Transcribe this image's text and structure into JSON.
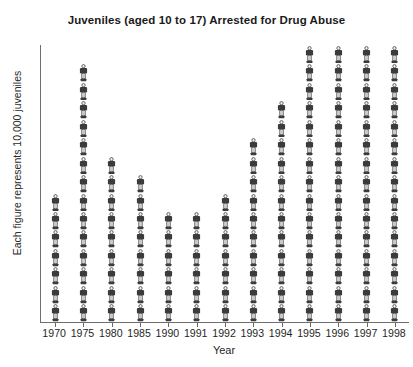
{
  "chart_data": {
    "type": "bar",
    "style": "pictograph",
    "title": "Juveniles (aged 10 to 17) Arrested for Drug Abuse",
    "xlabel": "Year",
    "ylabel": "Each figure represents 10,000 juveniles",
    "unit_per_icon": 10000,
    "icon": "person-icon",
    "legend": "none",
    "grid": "off",
    "categories": [
      "1970",
      "1975",
      "1980",
      "1985",
      "1990",
      "1991",
      "1992",
      "1993",
      "1994",
      "1995",
      "1996",
      "1997",
      "1998"
    ],
    "icon_counts": [
      7,
      14,
      9,
      8,
      6,
      6,
      7,
      10,
      12,
      15,
      15,
      15,
      15
    ],
    "values": [
      70000,
      140000,
      90000,
      80000,
      60000,
      60000,
      70000,
      100000,
      120000,
      150000,
      150000,
      150000,
      150000
    ],
    "ylim_icons": [
      0,
      15
    ],
    "colors": {
      "figure_dark": "#3b3b3b",
      "figure_light": "#efefef",
      "figure_outline": "#4a4a4a",
      "axis": "#6e6e6e",
      "text": "#1a1a1a",
      "background": "#ffffff"
    }
  }
}
